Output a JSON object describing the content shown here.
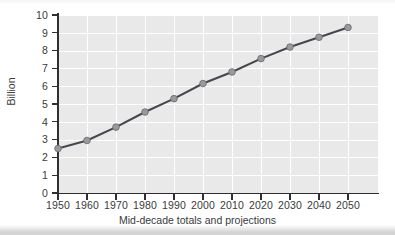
{
  "chart_data": {
    "type": "line",
    "title": "",
    "xlabel": "Mid-decade totals and projections",
    "ylabel": "Billion",
    "x": [
      1950,
      1960,
      1970,
      1980,
      1990,
      2000,
      2010,
      2020,
      2030,
      2040,
      2050
    ],
    "values": [
      2.5,
      2.95,
      3.7,
      4.55,
      5.3,
      6.15,
      6.8,
      7.55,
      8.2,
      8.75,
      9.3
    ],
    "series": [
      {
        "name": "World population",
        "values": [
          2.5,
          2.95,
          3.7,
          4.55,
          5.3,
          6.15,
          6.8,
          7.55,
          8.2,
          8.75,
          9.3
        ]
      }
    ],
    "x_tick_labels": [
      "1950",
      "1960",
      "1970",
      "1980",
      "1990",
      "2000",
      "2010",
      "2020",
      "2030",
      "2040",
      "2050"
    ],
    "y_tick_labels": [
      "0",
      "1",
      "2",
      "3",
      "4",
      "5",
      "6",
      "7",
      "8",
      "9",
      "10"
    ],
    "y_ticks": [
      0,
      1,
      2,
      3,
      4,
      5,
      6,
      7,
      8,
      9,
      10
    ],
    "xlim": [
      1950,
      2050
    ],
    "ylim": [
      0,
      10
    ],
    "grid": true,
    "grid_color": "#ffffff",
    "legend": false,
    "legend_position": "none",
    "plot_background": "#e9e9e9",
    "line_color": "#46464f",
    "marker_color": "#9a9a9a",
    "marker_edge_color": "#6e6e75",
    "axis_color": "#2e2e33",
    "text_color": "#3a3a3a"
  }
}
